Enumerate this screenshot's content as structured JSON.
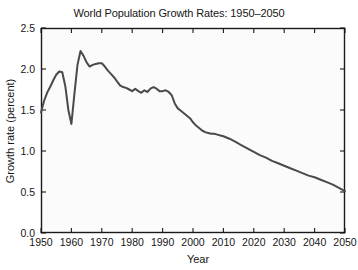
{
  "chart_data": {
    "type": "line",
    "title": "World Population Growth Rates: 1950–2050",
    "xlabel": "Year",
    "ylabel": "Growth rate (percent)",
    "xlim": [
      1950,
      2050
    ],
    "ylim": [
      0.0,
      2.5
    ],
    "xticks": [
      1950,
      1960,
      1970,
      1980,
      1990,
      2000,
      2010,
      2020,
      2030,
      2040,
      2050
    ],
    "xtick_labels": [
      "1950",
      "1960",
      "1970",
      "1980",
      "1990",
      "2000",
      "2010",
      "2020",
      "2030",
      "2040",
      "2050"
    ],
    "yticks": [
      0.0,
      0.5,
      1.0,
      1.5,
      2.0,
      2.5
    ],
    "ytick_labels": [
      "0.0",
      "0.5",
      "1.0",
      "1.5",
      "2.0",
      "2.5"
    ],
    "grid": false,
    "legend": false,
    "line_color": "#4a4a4a",
    "line_width": 2.0,
    "background_color": "#fbfbfb",
    "frame_color": "#1a1a1a",
    "series": [
      {
        "name": "World population growth rate",
        "x": [
          1950,
          1951,
          1952,
          1953,
          1954,
          1955,
          1956,
          1957,
          1958,
          1959,
          1960,
          1961,
          1962,
          1963,
          1964,
          1965,
          1966,
          1967,
          1968,
          1969,
          1970,
          1971,
          1972,
          1973,
          1974,
          1975,
          1976,
          1977,
          1978,
          1979,
          1980,
          1981,
          1982,
          1983,
          1984,
          1985,
          1986,
          1987,
          1988,
          1989,
          1990,
          1991,
          1992,
          1993,
          1994,
          1995,
          1996,
          1997,
          1998,
          1999,
          2000,
          2001,
          2002,
          2003,
          2004,
          2005,
          2006,
          2007,
          2008,
          2009,
          2010,
          2012,
          2014,
          2016,
          2018,
          2020,
          2022,
          2024,
          2026,
          2028,
          2030,
          2032,
          2034,
          2036,
          2038,
          2040,
          2042,
          2044,
          2046,
          2048,
          2050
        ],
        "y": [
          1.47,
          1.61,
          1.71,
          1.78,
          1.86,
          1.93,
          1.97,
          1.96,
          1.79,
          1.5,
          1.33,
          1.7,
          2.05,
          2.22,
          2.16,
          2.08,
          2.03,
          2.05,
          2.06,
          2.07,
          2.07,
          2.03,
          1.98,
          1.94,
          1.9,
          1.85,
          1.8,
          1.78,
          1.77,
          1.75,
          1.73,
          1.76,
          1.73,
          1.71,
          1.74,
          1.72,
          1.76,
          1.78,
          1.76,
          1.73,
          1.73,
          1.74,
          1.72,
          1.68,
          1.58,
          1.52,
          1.49,
          1.46,
          1.43,
          1.4,
          1.35,
          1.31,
          1.28,
          1.25,
          1.23,
          1.22,
          1.21,
          1.21,
          1.2,
          1.19,
          1.18,
          1.15,
          1.11,
          1.07,
          1.03,
          0.99,
          0.95,
          0.92,
          0.88,
          0.85,
          0.82,
          0.79,
          0.76,
          0.73,
          0.7,
          0.68,
          0.65,
          0.62,
          0.59,
          0.55,
          0.51
        ]
      }
    ]
  }
}
